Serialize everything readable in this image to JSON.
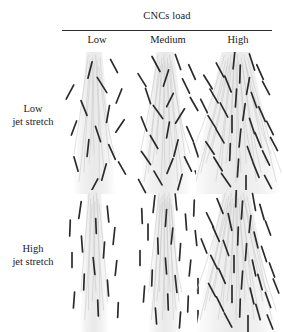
{
  "figure": {
    "type": "schematic-matrix",
    "column_header_title": "CNCs load",
    "column_labels": [
      "Low",
      "Medium",
      "High"
    ],
    "row_labels": [
      {
        "line1": "Low",
        "line2": "jet stretch"
      },
      {
        "line1": "High",
        "line2": "jet stretch"
      }
    ],
    "colors": {
      "rod": "#2b2b2b",
      "filament": "#c9c9c9",
      "band": "#f2f2f2",
      "rule": "#2b2b2b",
      "text": "#1a1a1a",
      "background": "#ffffff"
    },
    "cells": [
      {
        "row": "Low jet stretch",
        "col": "Low",
        "cnc_count": 16,
        "alignment": "random",
        "band_width": 14,
        "splay": 0.18,
        "rods": [
          {
            "x": 28,
            "y": 18,
            "len": 17,
            "angle": 104
          },
          {
            "x": 52,
            "y": 14,
            "len": 15,
            "angle": 62
          },
          {
            "x": 8,
            "y": 40,
            "len": 16,
            "angle": 118
          },
          {
            "x": 40,
            "y": 33,
            "len": 18,
            "angle": 58
          },
          {
            "x": 57,
            "y": 44,
            "len": 15,
            "angle": 112
          },
          {
            "x": 22,
            "y": 56,
            "len": 16,
            "angle": 68
          },
          {
            "x": 46,
            "y": 62,
            "len": 17,
            "angle": 100
          },
          {
            "x": 12,
            "y": 76,
            "len": 15,
            "angle": 110
          },
          {
            "x": 36,
            "y": 82,
            "len": 16,
            "angle": 72
          },
          {
            "x": 58,
            "y": 74,
            "len": 15,
            "angle": 124
          },
          {
            "x": 26,
            "y": 96,
            "len": 17,
            "angle": 96
          },
          {
            "x": 50,
            "y": 100,
            "len": 16,
            "angle": 66
          },
          {
            "x": 14,
            "y": 112,
            "len": 15,
            "angle": 74
          },
          {
            "x": 42,
            "y": 120,
            "len": 17,
            "angle": 106
          },
          {
            "x": 60,
            "y": 116,
            "len": 14,
            "angle": 60
          },
          {
            "x": 32,
            "y": 134,
            "len": 16,
            "angle": 118
          }
        ]
      },
      {
        "row": "Low jet stretch",
        "col": "Medium",
        "cnc_count": 24,
        "alignment": "random",
        "band_width": 16,
        "splay": 0.22,
        "rods": [
          {
            "x": 24,
            "y": 12,
            "len": 17,
            "angle": 62
          },
          {
            "x": 46,
            "y": 10,
            "len": 16,
            "angle": 70
          },
          {
            "x": 60,
            "y": 20,
            "len": 16,
            "angle": 66
          },
          {
            "x": 10,
            "y": 28,
            "len": 15,
            "angle": 58
          },
          {
            "x": 34,
            "y": 26,
            "len": 17,
            "angle": 108
          },
          {
            "x": 54,
            "y": 34,
            "len": 16,
            "angle": 64
          },
          {
            "x": 16,
            "y": 44,
            "len": 16,
            "angle": 72
          },
          {
            "x": 38,
            "y": 48,
            "len": 15,
            "angle": 116
          },
          {
            "x": 62,
            "y": 52,
            "len": 15,
            "angle": 60
          },
          {
            "x": 26,
            "y": 60,
            "len": 16,
            "angle": 54
          },
          {
            "x": 48,
            "y": 64,
            "len": 17,
            "angle": 122
          },
          {
            "x": 12,
            "y": 72,
            "len": 15,
            "angle": 68
          },
          {
            "x": 36,
            "y": 78,
            "len": 16,
            "angle": 100
          },
          {
            "x": 58,
            "y": 82,
            "len": 16,
            "angle": 66
          },
          {
            "x": 22,
            "y": 90,
            "len": 15,
            "angle": 60
          },
          {
            "x": 44,
            "y": 96,
            "len": 17,
            "angle": 104
          },
          {
            "x": 64,
            "y": 98,
            "len": 15,
            "angle": 72
          },
          {
            "x": 14,
            "y": 106,
            "len": 16,
            "angle": 56
          },
          {
            "x": 38,
            "y": 114,
            "len": 16,
            "angle": 112
          },
          {
            "x": 56,
            "y": 112,
            "len": 16,
            "angle": 64
          },
          {
            "x": 26,
            "y": 126,
            "len": 16,
            "angle": 60
          },
          {
            "x": 48,
            "y": 130,
            "len": 16,
            "angle": 106
          },
          {
            "x": 66,
            "y": 126,
            "len": 15,
            "angle": 68
          },
          {
            "x": 10,
            "y": 134,
            "len": 15,
            "angle": 62
          }
        ]
      },
      {
        "row": "Low jet stretch",
        "col": "High",
        "cnc_count": 34,
        "alignment": "partially-aligned",
        "band_width": 26,
        "splay": 0.4,
        "rods": [
          {
            "x": 38,
            "y": 8,
            "len": 18,
            "angle": 96
          },
          {
            "x": 56,
            "y": 10,
            "len": 17,
            "angle": 72
          },
          {
            "x": 24,
            "y": 18,
            "len": 16,
            "angle": 62
          },
          {
            "x": 44,
            "y": 22,
            "len": 18,
            "angle": 92
          },
          {
            "x": 64,
            "y": 20,
            "len": 16,
            "angle": 66
          },
          {
            "x": 12,
            "y": 30,
            "len": 16,
            "angle": 58
          },
          {
            "x": 32,
            "y": 32,
            "len": 17,
            "angle": 68
          },
          {
            "x": 52,
            "y": 34,
            "len": 17,
            "angle": 100
          },
          {
            "x": 70,
            "y": 36,
            "len": 15,
            "angle": 62
          },
          {
            "x": 18,
            "y": 44,
            "len": 16,
            "angle": 60
          },
          {
            "x": 40,
            "y": 46,
            "len": 18,
            "angle": 94
          },
          {
            "x": 58,
            "y": 48,
            "len": 16,
            "angle": 70
          },
          {
            "x": 8,
            "y": 54,
            "len": 15,
            "angle": 64
          },
          {
            "x": 28,
            "y": 58,
            "len": 16,
            "angle": 62
          },
          {
            "x": 48,
            "y": 60,
            "len": 17,
            "angle": 98
          },
          {
            "x": 66,
            "y": 62,
            "len": 16,
            "angle": 66
          },
          {
            "x": 16,
            "y": 70,
            "len": 15,
            "angle": 58
          },
          {
            "x": 36,
            "y": 72,
            "len": 17,
            "angle": 90
          },
          {
            "x": 56,
            "y": 74,
            "len": 16,
            "angle": 72
          },
          {
            "x": 74,
            "y": 76,
            "len": 15,
            "angle": 64
          },
          {
            "x": 24,
            "y": 84,
            "len": 16,
            "angle": 60
          },
          {
            "x": 44,
            "y": 86,
            "len": 18,
            "angle": 96
          },
          {
            "x": 62,
            "y": 88,
            "len": 16,
            "angle": 68
          },
          {
            "x": 78,
            "y": 92,
            "len": 15,
            "angle": 62
          },
          {
            "x": 14,
            "y": 96,
            "len": 15,
            "angle": 56
          },
          {
            "x": 34,
            "y": 100,
            "len": 17,
            "angle": 92
          },
          {
            "x": 54,
            "y": 102,
            "len": 16,
            "angle": 70
          },
          {
            "x": 70,
            "y": 106,
            "len": 16,
            "angle": 64
          },
          {
            "x": 22,
            "y": 112,
            "len": 16,
            "angle": 58
          },
          {
            "x": 42,
            "y": 116,
            "len": 18,
            "angle": 94
          },
          {
            "x": 60,
            "y": 118,
            "len": 16,
            "angle": 68
          },
          {
            "x": 30,
            "y": 128,
            "len": 16,
            "angle": 56
          },
          {
            "x": 50,
            "y": 132,
            "len": 17,
            "angle": 90
          },
          {
            "x": 72,
            "y": 130,
            "len": 15,
            "angle": 62
          }
        ]
      },
      {
        "row": "High jet stretch",
        "col": "Low",
        "cnc_count": 15,
        "alignment": "aligned",
        "band_width": 12,
        "splay": 0.1,
        "rods": [
          {
            "x": 18,
            "y": 20,
            "len": 17,
            "angle": 98
          },
          {
            "x": 46,
            "y": 24,
            "len": 16,
            "angle": 84
          },
          {
            "x": 8,
            "y": 38,
            "len": 16,
            "angle": 92
          },
          {
            "x": 34,
            "y": 36,
            "len": 15,
            "angle": 88
          },
          {
            "x": 52,
            "y": 46,
            "len": 17,
            "angle": 96
          },
          {
            "x": 20,
            "y": 54,
            "len": 16,
            "angle": 86
          },
          {
            "x": 42,
            "y": 60,
            "len": 16,
            "angle": 94
          },
          {
            "x": 10,
            "y": 70,
            "len": 15,
            "angle": 90
          },
          {
            "x": 32,
            "y": 76,
            "len": 17,
            "angle": 84
          },
          {
            "x": 54,
            "y": 78,
            "len": 15,
            "angle": 96
          },
          {
            "x": 22,
            "y": 92,
            "len": 16,
            "angle": 92
          },
          {
            "x": 46,
            "y": 98,
            "len": 16,
            "angle": 86
          },
          {
            "x": 12,
            "y": 110,
            "len": 16,
            "angle": 94
          },
          {
            "x": 36,
            "y": 118,
            "len": 16,
            "angle": 88
          },
          {
            "x": 56,
            "y": 120,
            "len": 15,
            "angle": 92
          }
        ]
      },
      {
        "row": "High jet stretch",
        "col": "Medium",
        "cnc_count": 23,
        "alignment": "aligned",
        "band_width": 14,
        "splay": 0.12,
        "rods": [
          {
            "x": 22,
            "y": 14,
            "len": 17,
            "angle": 96
          },
          {
            "x": 44,
            "y": 12,
            "len": 16,
            "angle": 84
          },
          {
            "x": 62,
            "y": 18,
            "len": 16,
            "angle": 92
          },
          {
            "x": 10,
            "y": 26,
            "len": 15,
            "angle": 88
          },
          {
            "x": 34,
            "y": 28,
            "len": 17,
            "angle": 94
          },
          {
            "x": 54,
            "y": 32,
            "len": 16,
            "angle": 86
          },
          {
            "x": 16,
            "y": 42,
            "len": 16,
            "angle": 90
          },
          {
            "x": 40,
            "y": 46,
            "len": 16,
            "angle": 96
          },
          {
            "x": 64,
            "y": 48,
            "len": 15,
            "angle": 84
          },
          {
            "x": 26,
            "y": 56,
            "len": 16,
            "angle": 88
          },
          {
            "x": 48,
            "y": 62,
            "len": 17,
            "angle": 94
          },
          {
            "x": 8,
            "y": 68,
            "len": 15,
            "angle": 90
          },
          {
            "x": 34,
            "y": 76,
            "len": 16,
            "angle": 86
          },
          {
            "x": 58,
            "y": 78,
            "len": 16,
            "angle": 96
          },
          {
            "x": 20,
            "y": 88,
            "len": 16,
            "angle": 92
          },
          {
            "x": 44,
            "y": 94,
            "len": 17,
            "angle": 84
          },
          {
            "x": 66,
            "y": 96,
            "len": 15,
            "angle": 90
          },
          {
            "x": 12,
            "y": 104,
            "len": 16,
            "angle": 94
          },
          {
            "x": 36,
            "y": 112,
            "len": 16,
            "angle": 88
          },
          {
            "x": 56,
            "y": 114,
            "len": 16,
            "angle": 92
          },
          {
            "x": 24,
            "y": 126,
            "len": 16,
            "angle": 86
          },
          {
            "x": 48,
            "y": 130,
            "len": 16,
            "angle": 94
          },
          {
            "x": 66,
            "y": 128,
            "len": 15,
            "angle": 90
          }
        ]
      },
      {
        "row": "High jet stretch",
        "col": "High",
        "cnc_count": 34,
        "alignment": "highly-aligned",
        "band_width": 24,
        "splay": 0.35,
        "rods": [
          {
            "x": 40,
            "y": 8,
            "len": 18,
            "angle": 92
          },
          {
            "x": 58,
            "y": 12,
            "len": 17,
            "angle": 80
          },
          {
            "x": 24,
            "y": 16,
            "len": 16,
            "angle": 68
          },
          {
            "x": 46,
            "y": 20,
            "len": 18,
            "angle": 94
          },
          {
            "x": 66,
            "y": 22,
            "len": 16,
            "angle": 74
          },
          {
            "x": 14,
            "y": 30,
            "len": 16,
            "angle": 64
          },
          {
            "x": 34,
            "y": 32,
            "len": 17,
            "angle": 78
          },
          {
            "x": 54,
            "y": 34,
            "len": 17,
            "angle": 96
          },
          {
            "x": 72,
            "y": 38,
            "len": 15,
            "angle": 70
          },
          {
            "x": 20,
            "y": 44,
            "len": 16,
            "angle": 66
          },
          {
            "x": 42,
            "y": 46,
            "len": 18,
            "angle": 92
          },
          {
            "x": 60,
            "y": 50,
            "len": 16,
            "angle": 76
          },
          {
            "x": 8,
            "y": 56,
            "len": 15,
            "angle": 68
          },
          {
            "x": 30,
            "y": 58,
            "len": 16,
            "angle": 70
          },
          {
            "x": 50,
            "y": 62,
            "len": 17,
            "angle": 94
          },
          {
            "x": 68,
            "y": 64,
            "len": 16,
            "angle": 72
          },
          {
            "x": 18,
            "y": 72,
            "len": 15,
            "angle": 64
          },
          {
            "x": 38,
            "y": 74,
            "len": 17,
            "angle": 90
          },
          {
            "x": 58,
            "y": 78,
            "len": 16,
            "angle": 78
          },
          {
            "x": 76,
            "y": 80,
            "len": 15,
            "angle": 70
          },
          {
            "x": 26,
            "y": 86,
            "len": 16,
            "angle": 66
          },
          {
            "x": 46,
            "y": 90,
            "len": 18,
            "angle": 94
          },
          {
            "x": 64,
            "y": 92,
            "len": 16,
            "angle": 74
          },
          {
            "x": 80,
            "y": 96,
            "len": 15,
            "angle": 68
          },
          {
            "x": 16,
            "y": 100,
            "len": 15,
            "angle": 62
          },
          {
            "x": 36,
            "y": 104,
            "len": 17,
            "angle": 90
          },
          {
            "x": 56,
            "y": 106,
            "len": 16,
            "angle": 76
          },
          {
            "x": 72,
            "y": 110,
            "len": 16,
            "angle": 70
          },
          {
            "x": 24,
            "y": 114,
            "len": 16,
            "angle": 64
          },
          {
            "x": 44,
            "y": 118,
            "len": 18,
            "angle": 92
          },
          {
            "x": 62,
            "y": 122,
            "len": 16,
            "angle": 74
          },
          {
            "x": 32,
            "y": 130,
            "len": 16,
            "angle": 62
          },
          {
            "x": 52,
            "y": 134,
            "len": 17,
            "angle": 90
          },
          {
            "x": 74,
            "y": 132,
            "len": 15,
            "angle": 68
          }
        ]
      }
    ]
  }
}
